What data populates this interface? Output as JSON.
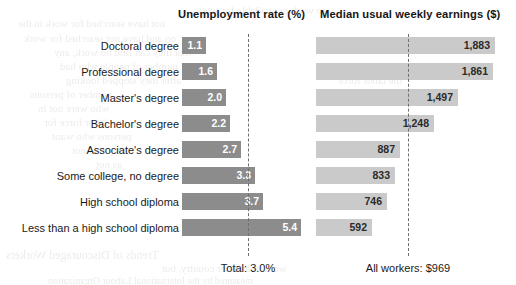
{
  "headers": {
    "unemployment": "Unemployment rate (%)",
    "earnings": "Median usual weekly earnings ($)"
  },
  "footers": {
    "unemployment": "Total: 3.0%",
    "earnings": "All workers: $969"
  },
  "colors": {
    "unemployment_bar": "#8c8c8c",
    "earnings_bar": "#cacaca",
    "reference_line": "#6f6f6f",
    "background": "#ffffff"
  },
  "chart_data": {
    "type": "bar",
    "title": "",
    "orientation": "horizontal",
    "grid": false,
    "legend": "none",
    "categories": [
      "Doctoral degree",
      "Professional degree",
      "Master's degree",
      "Bachelor's degree",
      "Associate's degree",
      "Some college, no degree",
      "High school diploma",
      "Less than a high school diploma"
    ],
    "series": [
      {
        "name": "Unemployment rate (%)",
        "values": [
          1.1,
          1.6,
          2.0,
          2.2,
          2.7,
          3.3,
          3.7,
          5.4
        ],
        "labels": [
          "1.1",
          "1.6",
          "2.0",
          "2.2",
          "2.7",
          "3.3",
          "3.7",
          "5.4"
        ],
        "reference_value": 3.0,
        "reference_label": "Total: 3.0%",
        "xlim": [
          0,
          6.0
        ]
      },
      {
        "name": "Median usual weekly earnings ($)",
        "values": [
          1883,
          1861,
          1497,
          1248,
          887,
          833,
          746,
          592
        ],
        "labels": [
          "1,883",
          "1,861",
          "1,497",
          "1,248",
          "887",
          "833",
          "746",
          "592"
        ],
        "reference_value": 969,
        "reference_label": "All workers: $969",
        "xlim": [
          0,
          2080
        ]
      }
    ]
  },
  "bleed_text": [
    {
      "t": "to work or available for work",
      "x": 196,
      "y": 4,
      "s": 11
    },
    {
      "t": "not have searched for work in the",
      "x": 18,
      "y": 17,
      "s": 11
    },
    {
      "t": "on and have not searched for work",
      "x": 24,
      "y": 32,
      "s": 11
    },
    {
      "t": "that they can find no work, any",
      "x": 54,
      "y": 46,
      "s": 11
    },
    {
      "t": "number of people who had",
      "x": 60,
      "y": 60,
      "s": 11
    },
    {
      "t": "after they stopped looking",
      "x": 66,
      "y": 74,
      "s": 11
    },
    {
      "t": "number of persons",
      "x": 30,
      "y": 88,
      "s": 11
    },
    {
      "t": "who were not in",
      "x": 38,
      "y": 102,
      "s": 11
    },
    {
      "t": "labor force for",
      "x": 44,
      "y": 116,
      "s": 11
    },
    {
      "t": "persons who want",
      "x": 52,
      "y": 130,
      "s": 11
    },
    {
      "t": "they had not",
      "x": 72,
      "y": 144,
      "s": 11
    },
    {
      "t": "as not",
      "x": 96,
      "y": 158,
      "s": 11
    },
    {
      "t": "the labor force",
      "x": 338,
      "y": 74,
      "s": 11
    },
    {
      "t": "Trends of Discouraged Workers",
      "x": 6,
      "y": 248,
      "s": 12
    },
    {
      "t": "work in another country, but",
      "x": 162,
      "y": 262,
      "s": 11
    },
    {
      "t": "measured by the International Labour Organization",
      "x": 48,
      "y": 275,
      "s": 10
    }
  ]
}
